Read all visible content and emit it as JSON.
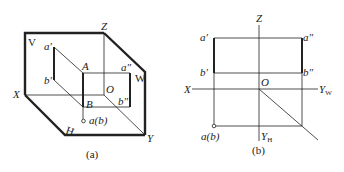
{
  "figure_a": {
    "caption": "(a)",
    "plane_labels": {
      "V": "V",
      "H": "H",
      "W": "W"
    },
    "axis_labels": {
      "X": "X",
      "Y": "Y",
      "Z": "Z",
      "O": "O"
    },
    "points": {
      "a_prime": "a′",
      "b_prime": "b′",
      "A": "A",
      "B": "B",
      "a_dprime": "a″",
      "b_dprime": "b″",
      "ab": "a(b)"
    }
  },
  "figure_b": {
    "caption": "(b)",
    "axis_labels": {
      "X": "X",
      "Z": "Z",
      "O": "O",
      "YW": "Y",
      "YW_sub": "W",
      "YH": "Y",
      "YH_sub": "H"
    },
    "points": {
      "a_prime": "a′",
      "b_prime": "b′",
      "a_dprime": "a″",
      "b_dprime": "b″",
      "ab": "a(b)"
    }
  },
  "colors": {
    "line": "#222222",
    "background": "#ffffff"
  }
}
